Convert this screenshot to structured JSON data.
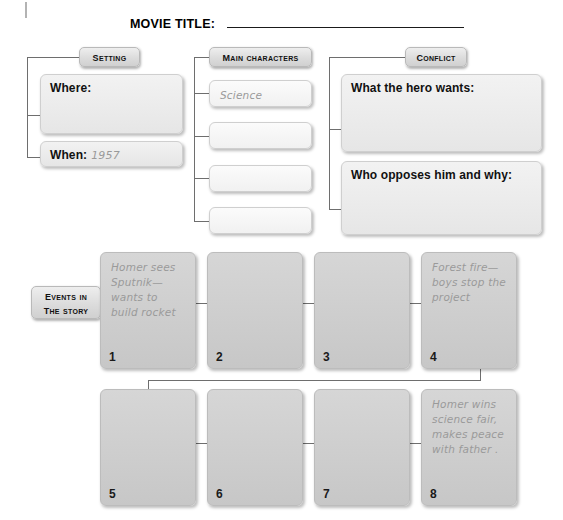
{
  "worksheet": {
    "title_label": "MOVIE TITLE:",
    "title_value": ""
  },
  "setting": {
    "header": "Setting",
    "where_label": "Where:",
    "where_value": "",
    "when_label": "When:",
    "when_value": "1957"
  },
  "main_characters": {
    "header": "Main Characters",
    "entries": [
      {
        "value": "Science teacher"
      },
      {
        "value": ""
      },
      {
        "value": ""
      },
      {
        "value": ""
      }
    ]
  },
  "conflict": {
    "header": "Conflict",
    "hero_wants_label": "What the hero wants:",
    "hero_wants_value": "",
    "opposes_label": "Who opposes him and why:",
    "opposes_value": ""
  },
  "events": {
    "header_line1": "Events in",
    "header_line2": "the story",
    "items": [
      {
        "number": "1",
        "text": "Homer sees Sputnik— wants to build rocket"
      },
      {
        "number": "2",
        "text": ""
      },
      {
        "number": "3",
        "text": ""
      },
      {
        "number": "4",
        "text": "Forest fire— boys stop the project"
      },
      {
        "number": "5",
        "text": ""
      },
      {
        "number": "6",
        "text": ""
      },
      {
        "number": "7",
        "text": ""
      },
      {
        "number": "8",
        "text": "Homer wins science fair, makes peace with father ."
      }
    ]
  },
  "colors": {
    "page_background": "#ffffff",
    "chip_fill": "#dcdcdc",
    "box_light": "#f1f1f1",
    "box_pale": "#e8e8e8",
    "box_mid": "#c9c9c9",
    "connector": "#6e6e6e",
    "handwriting": "#9a9a9a",
    "text": "#111111"
  }
}
